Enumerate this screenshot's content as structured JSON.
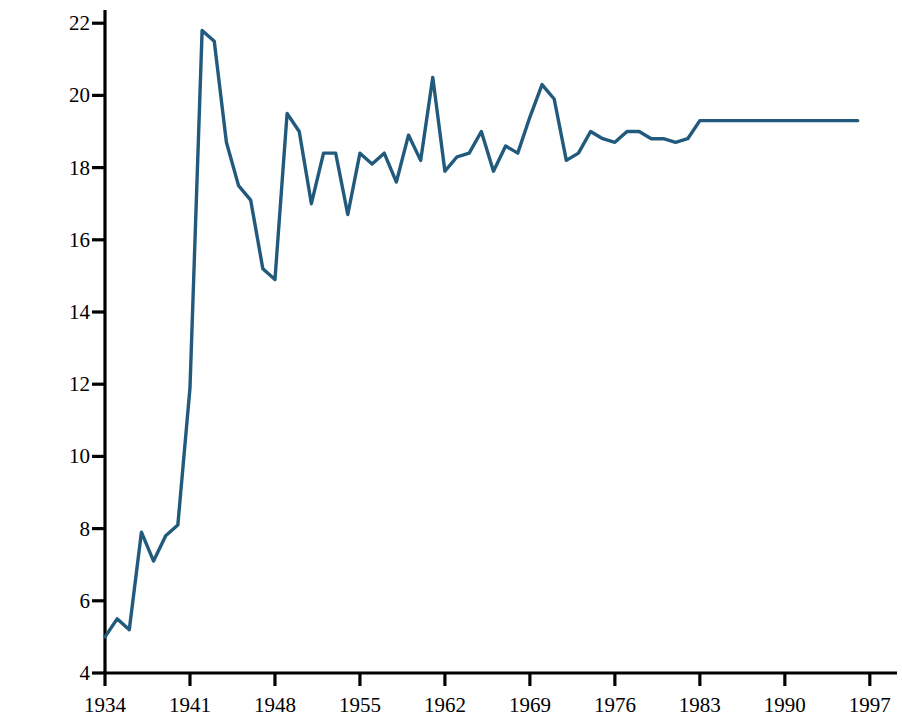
{
  "chart_data": {
    "type": "line",
    "title": "",
    "subtitle": "",
    "xlabel": "",
    "ylabel": "Percentage of GDP",
    "xlim": [
      1934,
      1997
    ],
    "ylim": [
      4,
      22
    ],
    "grid": false,
    "legend": "none",
    "line_color": "#215a7d",
    "line_width": 3.4,
    "axis_color": "#000000",
    "background": "#ffffff",
    "xticks": [
      1934,
      1941,
      1948,
      1955,
      1962,
      1969,
      1976,
      1983,
      1990,
      1997
    ],
    "xtick_labels": [
      "1934",
      "1941",
      "1948",
      "1955",
      "1962",
      "1969",
      "1976",
      "1983",
      "1990",
      "1997"
    ],
    "yticks": [
      4,
      6,
      8,
      10,
      12,
      14,
      16,
      18,
      20,
      22
    ],
    "ytick_labels": [
      "4",
      "6",
      "8",
      "10",
      "12",
      "14",
      "16",
      "18",
      "20",
      "22"
    ],
    "x": [
      1934,
      1935,
      1936,
      1937,
      1938,
      1939,
      1940,
      1941,
      1942,
      1943,
      1944,
      1945,
      1946,
      1947,
      1948,
      1949,
      1950,
      1951,
      1952,
      1953,
      1954,
      1955,
      1956,
      1957,
      1958,
      1959,
      1960,
      1961,
      1962,
      1963,
      1964,
      1965,
      1966,
      1967,
      1968,
      1969,
      1970,
      1971,
      1972,
      1973,
      1974,
      1975,
      1976,
      1977,
      1978,
      1979,
      1980,
      1981,
      1982,
      1983,
      1984,
      1985,
      1986,
      1987,
      1988,
      1989,
      1990,
      1991,
      1992,
      1993,
      1994,
      1995,
      1996
    ],
    "values": [
      5.0,
      5.5,
      5.2,
      7.9,
      7.1,
      7.8,
      8.1,
      11.9,
      21.8,
      21.5,
      18.7,
      17.5,
      17.1,
      15.2,
      14.9,
      19.5,
      19.0,
      17.0,
      18.4,
      18.4,
      16.7,
      18.4,
      18.1,
      18.4,
      17.6,
      18.9,
      18.2,
      20.5,
      17.9,
      18.3,
      18.4,
      19.0,
      17.9,
      18.6,
      18.4,
      19.4,
      20.3,
      19.9,
      18.2,
      18.4,
      19.0,
      18.8,
      18.7,
      19.0,
      19.0,
      18.8,
      18.8,
      18.7,
      18.8,
      19.3,
      19.3,
      19.3,
      19.3,
      19.3,
      19.3,
      19.3,
      19.3,
      19.3,
      19.3,
      19.3,
      19.3,
      19.3,
      19.3
    ],
    "series_name": "Federal outlays as percentage of GDP"
  },
  "axis": {
    "y_title": "Percentage of GDP"
  }
}
